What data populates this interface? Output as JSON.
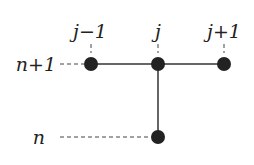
{
  "diagram": {
    "column_labels": [
      "j−1",
      "j",
      "j+1"
    ],
    "row_labels": [
      "n+1",
      "n"
    ],
    "nodes": [
      {
        "id": "n1-jm1",
        "row": "n+1",
        "col": "j-1"
      },
      {
        "id": "n1-j",
        "row": "n+1",
        "col": "j"
      },
      {
        "id": "n1-jp1",
        "row": "n+1",
        "col": "j+1"
      },
      {
        "id": "n-j",
        "row": "n",
        "col": "j"
      }
    ]
  }
}
